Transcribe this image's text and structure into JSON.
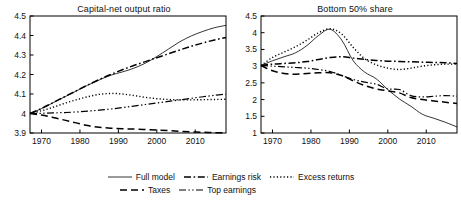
{
  "figure": {
    "legend": {
      "rows": [
        [
          {
            "label": "Full model",
            "style": "solid"
          },
          {
            "label": "Earnings risk",
            "style": "dashdot"
          },
          {
            "label": "Excess returns",
            "style": "dotted"
          }
        ],
        [
          {
            "label": "Taxes",
            "style": "dashed"
          },
          {
            "label": "Top earnings",
            "style": "dashdotdot"
          }
        ]
      ]
    }
  },
  "chart_data": [
    {
      "type": "line",
      "title": "Capital-net output ratio",
      "xlabel": "",
      "ylabel": "",
      "xlim": [
        1967,
        2018
      ],
      "ylim": [
        3.9,
        4.5
      ],
      "xticks": [
        1970,
        1980,
        1990,
        2000,
        2010
      ],
      "yticks": [
        3.9,
        4.0,
        4.1,
        4.2,
        4.3,
        4.4,
        4.5
      ],
      "ytick_labels": [
        "3.9",
        "4",
        "4.1",
        "4.2",
        "4.3",
        "4.4",
        "4.5"
      ],
      "grid": false,
      "legend_position": "below-figure",
      "x": [
        1967,
        1970,
        1973,
        1976,
        1979,
        1982,
        1985,
        1988,
        1991,
        1994,
        1997,
        2000,
        2003,
        2006,
        2009,
        2012,
        2015,
        2018
      ],
      "series": [
        {
          "name": "Full model",
          "style": "solid",
          "values": [
            4.0,
            4.025,
            4.055,
            4.085,
            4.115,
            4.145,
            4.172,
            4.196,
            4.213,
            4.232,
            4.258,
            4.292,
            4.33,
            4.368,
            4.398,
            4.421,
            4.44,
            4.452
          ]
        },
        {
          "name": "Earnings risk",
          "style": "dashdot",
          "values": [
            4.0,
            4.026,
            4.056,
            4.086,
            4.116,
            4.146,
            4.174,
            4.2,
            4.224,
            4.246,
            4.266,
            4.286,
            4.306,
            4.326,
            4.345,
            4.362,
            4.377,
            4.39
          ]
        },
        {
          "name": "Excess returns",
          "style": "dotted",
          "values": [
            4.0,
            4.014,
            4.032,
            4.052,
            4.07,
            4.086,
            4.098,
            4.103,
            4.1,
            4.092,
            4.083,
            4.076,
            4.072,
            4.07,
            4.07,
            4.071,
            4.072,
            4.073
          ]
        },
        {
          "name": "Taxes",
          "style": "dashed",
          "values": [
            4.0,
            3.992,
            3.98,
            3.966,
            3.952,
            3.938,
            3.929,
            3.925,
            3.922,
            3.92,
            3.918,
            3.915,
            3.912,
            3.909,
            3.906,
            3.904,
            3.902,
            3.901
          ]
        },
        {
          "name": "Top earnings",
          "style": "dashdotdot",
          "values": [
            4.0,
            4.001,
            4.003,
            4.005,
            4.008,
            4.012,
            4.017,
            4.023,
            4.03,
            4.038,
            4.046,
            4.054,
            4.062,
            4.07,
            4.078,
            4.086,
            4.093,
            4.1
          ]
        }
      ]
    },
    {
      "type": "line",
      "title": "Bottom 50% share",
      "xlabel": "",
      "ylabel": "",
      "xlim": [
        1967,
        2018
      ],
      "ylim": [
        1.0,
        4.5
      ],
      "xticks": [
        1970,
        1980,
        1990,
        2000,
        2010
      ],
      "yticks": [
        1.0,
        1.5,
        2.0,
        2.5,
        3.0,
        3.5,
        4.0,
        4.5
      ],
      "ytick_labels": [
        "1",
        "1.5",
        "2",
        "2.5",
        "3",
        "3.5",
        "4",
        "4.5"
      ],
      "grid": false,
      "legend_position": "below-figure",
      "x": [
        1967,
        1970,
        1973,
        1976,
        1979,
        1982,
        1985,
        1988,
        1991,
        1994,
        1997,
        2000,
        2003,
        2006,
        2009,
        2012,
        2015,
        2018
      ],
      "series": [
        {
          "name": "Full model",
          "style": "solid",
          "values": [
            3.02,
            3.16,
            3.28,
            3.4,
            3.62,
            3.92,
            4.1,
            3.78,
            3.16,
            2.82,
            2.62,
            2.3,
            2.02,
            1.8,
            1.56,
            1.44,
            1.32,
            1.18
          ]
        },
        {
          "name": "Earnings risk",
          "style": "dashdot",
          "values": [
            3.02,
            3.06,
            3.08,
            3.1,
            3.14,
            3.2,
            3.26,
            3.28,
            3.24,
            3.2,
            3.17,
            3.15,
            3.14,
            3.13,
            3.12,
            3.11,
            3.1,
            3.08
          ]
        },
        {
          "name": "Excess returns",
          "style": "dotted",
          "values": [
            3.02,
            3.26,
            3.42,
            3.58,
            3.78,
            4.0,
            4.12,
            3.96,
            3.56,
            3.22,
            3.04,
            2.94,
            2.9,
            2.94,
            3.0,
            3.04,
            3.06,
            3.06
          ]
        },
        {
          "name": "Taxes",
          "style": "dashed",
          "values": [
            3.02,
            2.86,
            2.78,
            2.76,
            2.78,
            2.8,
            2.8,
            2.72,
            2.56,
            2.42,
            2.32,
            2.26,
            2.2,
            2.06,
            2.0,
            1.96,
            1.92,
            1.88
          ]
        },
        {
          "name": "Top earnings",
          "style": "dashdotdot",
          "values": [
            3.02,
            3.0,
            2.98,
            2.96,
            2.94,
            2.9,
            2.84,
            2.72,
            2.6,
            2.52,
            2.46,
            2.32,
            2.3,
            2.12,
            2.08,
            2.1,
            2.12,
            2.1
          ]
        }
      ]
    }
  ]
}
